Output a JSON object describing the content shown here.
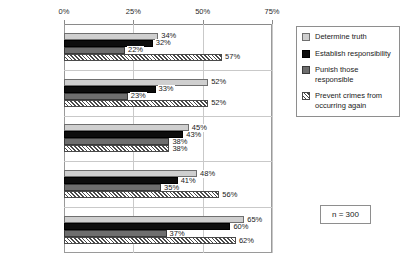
{
  "chart_data": {
    "type": "bar",
    "orientation": "horizontal",
    "title": "",
    "subtitle": "",
    "xlabel": "",
    "ylabel": "",
    "xlim": [
      0,
      75
    ],
    "xticks": [
      "0%",
      "25%",
      "50%",
      "75%"
    ],
    "xtick_values": [
      0,
      25,
      50,
      75
    ],
    "grid": true,
    "legend_position": "right",
    "categories": [
      "1st Quintile",
      "2nd Quintile",
      "3rd Quintile",
      "4th Quintile",
      "5th Quintile"
    ],
    "series": [
      {
        "name": "Determine truth",
        "fill": "light-gray",
        "values": [
          34,
          52,
          45,
          48,
          65
        ],
        "labels": [
          "34%",
          "52%",
          "45%",
          "48%",
          "65%"
        ]
      },
      {
        "name": "Establish responsibility",
        "fill": "black",
        "values": [
          32,
          33,
          43,
          41,
          60
        ],
        "labels": [
          "32%",
          "33%",
          "43%",
          "41%",
          "60%"
        ]
      },
      {
        "name": "Punish those responsible",
        "fill": "dark-gray",
        "values": [
          22,
          23,
          38,
          35,
          37
        ],
        "labels": [
          "22%",
          "23%",
          "38%",
          "35%",
          "37%"
        ]
      },
      {
        "name": "Prevent crimes from occurring again",
        "fill": "diagonal-hatch",
        "values": [
          57,
          52,
          38,
          56,
          62
        ],
        "labels": [
          "57%",
          "52%",
          "38%",
          "56%",
          "62%"
        ]
      }
    ],
    "annotations": [
      {
        "name": "sample-size",
        "text": "n = 300"
      }
    ]
  },
  "legend": {
    "items": [
      {
        "label": "Determine truth"
      },
      {
        "label": "Establish responsibility"
      },
      {
        "label": "Punish those responsible"
      },
      {
        "label": "Prevent crimes from occurring again"
      }
    ]
  },
  "note": {
    "sample_size": "n = 300"
  },
  "colors": {
    "series_0": "#cfcfcf",
    "series_1": "#0d0d0d",
    "series_2": "#6e6e6e",
    "series_3": "#ffffff",
    "axis": "#8a8a8a",
    "grid": "#c9c9c9",
    "text": "#1a1a1a"
  }
}
